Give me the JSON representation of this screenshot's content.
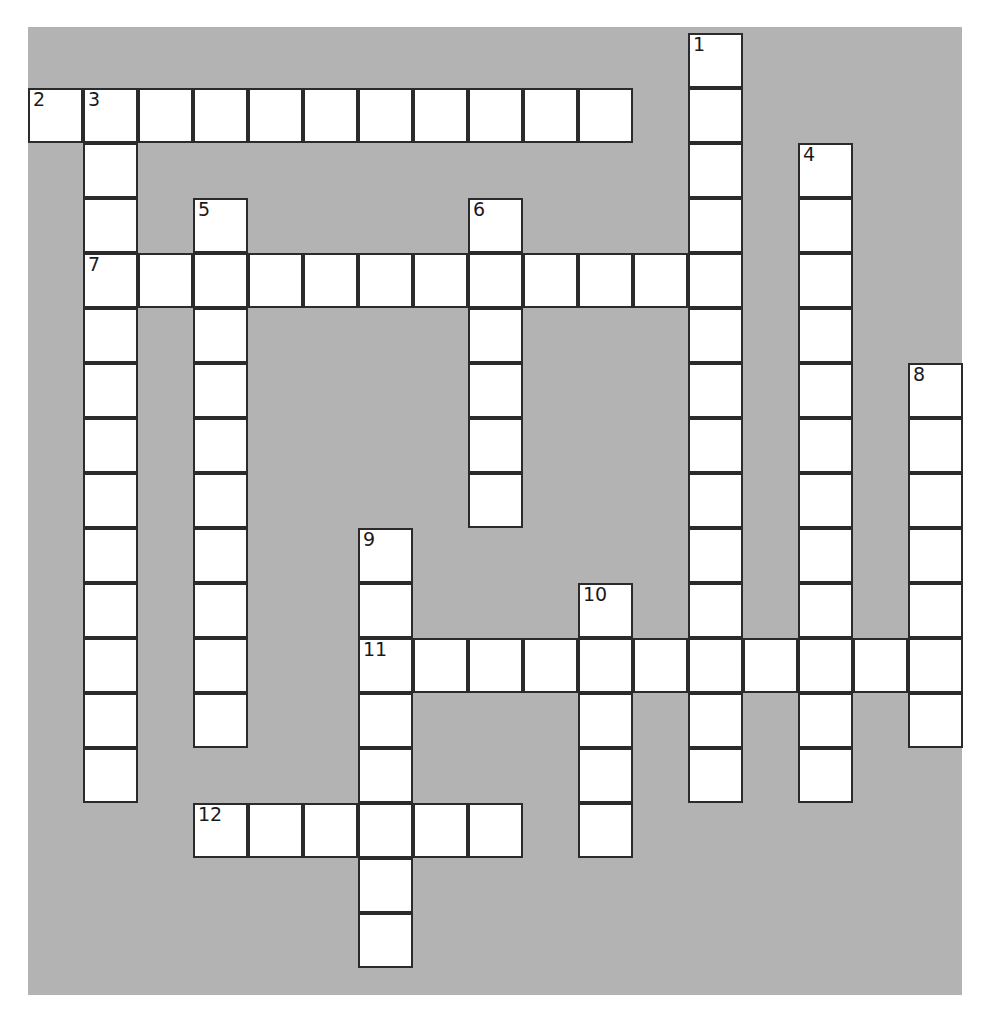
{
  "puzzle": {
    "title": "Crossword Puzzle Grid",
    "kind": "crossword-grid",
    "cell_size": 55,
    "origin_x": 28,
    "origin_y": 33,
    "colors": {
      "background": "#b3b3b3",
      "cell_fill": "#ffffff",
      "cell_border": "#2b2b2b",
      "number_text": "#1a1a1a",
      "page": "#ffffff"
    },
    "backdrop": {
      "x": 28,
      "y": 27,
      "width": 934,
      "height": 968
    },
    "entry_count": 12,
    "entries": [
      {
        "number": "1",
        "direction": "down",
        "col": 12,
        "row": 0,
        "length": 14
      },
      {
        "number": "2",
        "direction": "across",
        "col": 0,
        "row": 1,
        "length": 11
      },
      {
        "number": "3",
        "direction": "down",
        "col": 1,
        "row": 1,
        "length": 13
      },
      {
        "number": "4",
        "direction": "down",
        "col": 14,
        "row": 2,
        "length": 12
      },
      {
        "number": "5",
        "direction": "down",
        "col": 3,
        "row": 3,
        "length": 10
      },
      {
        "number": "6",
        "direction": "down",
        "col": 8,
        "row": 3,
        "length": 6
      },
      {
        "number": "7",
        "direction": "across",
        "col": 1,
        "row": 4,
        "length": 12
      },
      {
        "number": "8",
        "direction": "down",
        "col": 16,
        "row": 6,
        "length": 7
      },
      {
        "number": "9",
        "direction": "down",
        "col": 6,
        "row": 9,
        "length": 8
      },
      {
        "number": "10",
        "direction": "down",
        "col": 10,
        "row": 10,
        "length": 5
      },
      {
        "number": "11",
        "direction": "across",
        "col": 6,
        "row": 11,
        "length": 11
      },
      {
        "number": "12",
        "direction": "across",
        "col": 3,
        "row": 14,
        "length": 6
      }
    ],
    "numbered_labels": [
      "1",
      "2",
      "3",
      "4",
      "5",
      "6",
      "7",
      "8",
      "9",
      "10",
      "11",
      "12"
    ]
  }
}
